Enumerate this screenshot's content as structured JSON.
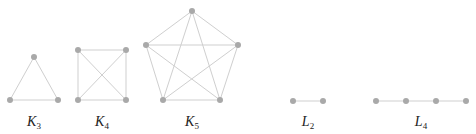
{
  "figure": {
    "colors": {
      "edge": "#cfcfcf",
      "vertex": "#a9a9a9",
      "label": "#222222",
      "background": "#ffffff"
    },
    "graphs": [
      {
        "id": "K3",
        "label_main": "K",
        "label_sub": "3",
        "label_pos": [
          34,
          114
        ],
        "vertices": [
          [
            34,
            57
          ],
          [
            10,
            100
          ],
          [
            58,
            100
          ]
        ],
        "edges": [
          [
            0,
            1
          ],
          [
            0,
            2
          ],
          [
            1,
            2
          ]
        ]
      },
      {
        "id": "K4",
        "label_main": "K",
        "label_sub": "4",
        "label_pos": [
          102,
          114
        ],
        "vertices": [
          [
            78,
            50
          ],
          [
            126,
            50
          ],
          [
            78,
            100
          ],
          [
            126,
            100
          ]
        ],
        "edges": [
          [
            0,
            1
          ],
          [
            0,
            2
          ],
          [
            0,
            3
          ],
          [
            1,
            2
          ],
          [
            1,
            3
          ],
          [
            2,
            3
          ]
        ]
      },
      {
        "id": "K5",
        "label_main": "K",
        "label_sub": "5",
        "label_pos": [
          192,
          114
        ],
        "vertices": [
          [
            192,
            11
          ],
          [
            146,
            45
          ],
          [
            238,
            45
          ],
          [
            163,
            100
          ],
          [
            220,
            100
          ]
        ],
        "edges": [
          [
            0,
            1
          ],
          [
            0,
            2
          ],
          [
            0,
            3
          ],
          [
            0,
            4
          ],
          [
            1,
            2
          ],
          [
            1,
            3
          ],
          [
            1,
            4
          ],
          [
            2,
            3
          ],
          [
            2,
            4
          ],
          [
            3,
            4
          ]
        ]
      },
      {
        "id": "L2",
        "label_main": "L",
        "label_sub": "2",
        "label_pos": [
          308,
          114
        ],
        "vertices": [
          [
            293,
            101
          ],
          [
            323,
            101
          ]
        ],
        "edges": [
          [
            0,
            1
          ]
        ]
      },
      {
        "id": "L4",
        "label_main": "L",
        "label_sub": "4",
        "label_pos": [
          421,
          114
        ],
        "vertices": [
          [
            376,
            101
          ],
          [
            406,
            101
          ],
          [
            436,
            101
          ],
          [
            466,
            101
          ]
        ],
        "edges": [
          [
            0,
            1
          ],
          [
            1,
            2
          ],
          [
            2,
            3
          ]
        ]
      }
    ]
  }
}
